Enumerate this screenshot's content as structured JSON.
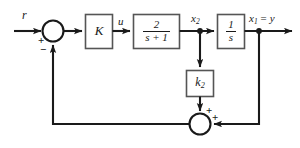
{
  "diagram": {
    "line_color": "#1a1a1a",
    "block_fill": "#ffffff",
    "background": "#ffffff",
    "signals": {
      "reference": "r",
      "control": "u",
      "state2": "x",
      "state2_sub": "2",
      "output_left": "x",
      "output_sub": "1",
      "output_eq": "= y"
    },
    "blocks": [
      {
        "id": "gain-k",
        "label": "K",
        "kind": "gain"
      },
      {
        "id": "plant-first-order",
        "numerator": "2",
        "denominator": "s + 1",
        "kind": "transfer-function"
      },
      {
        "id": "integrator",
        "numerator": "1",
        "denominator": "s",
        "kind": "transfer-function"
      },
      {
        "id": "gain-k2",
        "label": "k",
        "label_sub": "2",
        "kind": "gain"
      }
    ],
    "summers": [
      {
        "id": "input-summer",
        "sign_left": "+",
        "sign_bottom": "−"
      },
      {
        "id": "feedback-summer",
        "sign_top": "+",
        "sign_right": "+"
      }
    ]
  }
}
